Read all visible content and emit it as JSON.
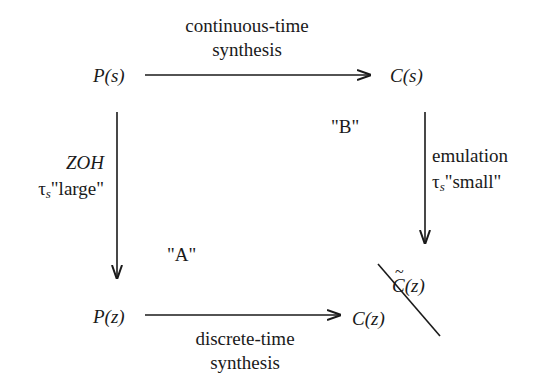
{
  "nodes": {
    "top_left": "P(s)",
    "top_right": "C(s)",
    "bottom_left": "P(z)",
    "bottom_right": "C(z)",
    "bottom_right_alt": "C(z)"
  },
  "edges": {
    "top": {
      "line1": "continuous-time",
      "line2": "synthesis"
    },
    "bottom": {
      "line1": "discrete-time",
      "line2": "synthesis"
    },
    "left": {
      "line1": "ZOH",
      "tau": "τ",
      "sub": "s",
      "quality": "\"large\""
    },
    "right": {
      "line1": "emulation",
      "tau": "τ",
      "sub": "s",
      "quality": "\"small\""
    }
  },
  "regions": {
    "a": "\"A\"",
    "b": "\"B\""
  },
  "colors": {
    "stroke": "#1a1a1a",
    "background": "#ffffff"
  }
}
